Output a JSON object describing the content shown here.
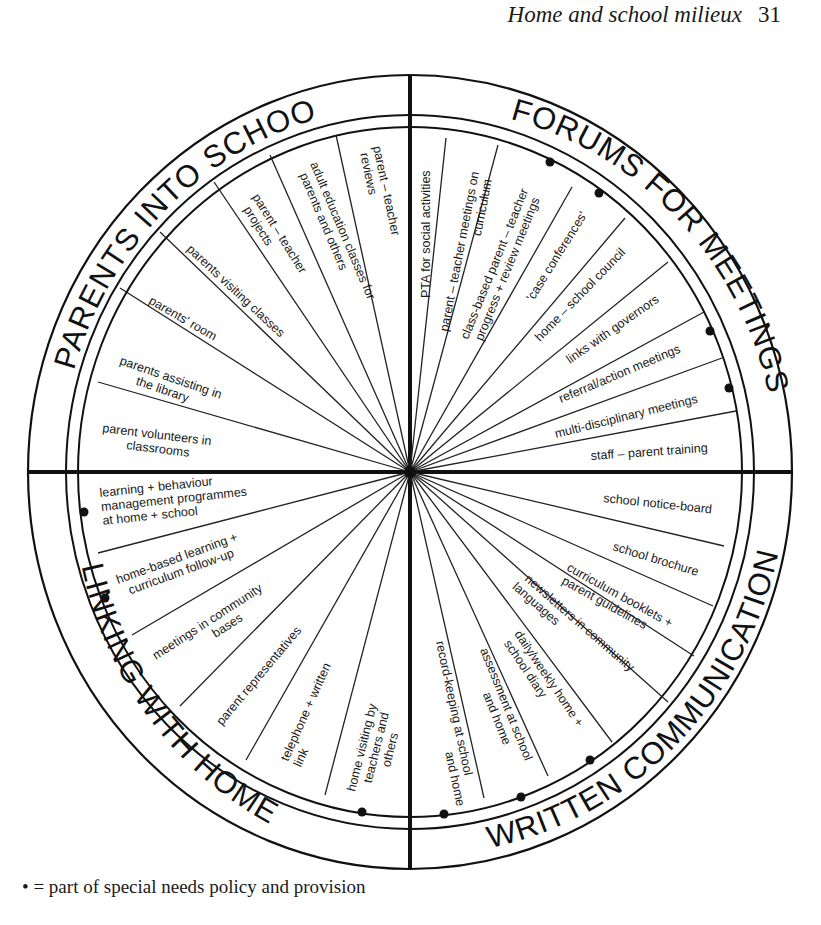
{
  "running_head": {
    "title": "Home and school milieux",
    "page": "31"
  },
  "diagram": {
    "type": "segmented circular diagram",
    "quadrants": [
      {
        "name": "PARENTS INTO SCHOOL",
        "position": "top-left",
        "items": [
          {
            "label": "parent – teacher reviews",
            "lines": [
              "parent – teacher",
              "reviews"
            ],
            "special_needs": false
          },
          {
            "label": "adult education classes for parents and others",
            "lines": [
              "adult education classes for",
              "parents and others"
            ],
            "special_needs": false
          },
          {
            "label": "parent – teacher projects",
            "lines": [
              "parent – teacher",
              "projects"
            ],
            "special_needs": false
          },
          {
            "label": "parents visiting classes",
            "lines": [
              "parents visiting classes"
            ],
            "special_needs": false
          },
          {
            "label": "parents' room",
            "lines": [
              "parents' room"
            ],
            "special_needs": false
          },
          {
            "label": "parents assisting in the library",
            "lines": [
              "parents assisting in",
              "the library"
            ],
            "special_needs": false
          },
          {
            "label": "parent volunteers in classrooms",
            "lines": [
              "parent volunteers in",
              "classrooms"
            ],
            "special_needs": false
          }
        ]
      },
      {
        "name": "FORUMS FOR MEETINGS",
        "position": "top-right",
        "items": [
          {
            "label": "PTA for social activities",
            "lines": [
              "PTA for social activities"
            ],
            "special_needs": false
          },
          {
            "label": "parent – teacher meetings on curriculum",
            "lines": [
              "parent – teacher meetings on",
              "curriculum"
            ],
            "special_needs": false
          },
          {
            "label": "class-based parent – teacher progress + review meetings",
            "lines": [
              "class-based parent – teacher",
              "progress + review meetings"
            ],
            "special_needs": true
          },
          {
            "label": "'case conferences'",
            "lines": [
              "'case conferences'"
            ],
            "special_needs": true
          },
          {
            "label": "home – school council",
            "lines": [
              "home – school council"
            ],
            "special_needs": false
          },
          {
            "label": "links with governors",
            "lines": [
              "links with governors"
            ],
            "special_needs": false
          },
          {
            "label": "referral/action meetings",
            "lines": [
              "referral/action meetings"
            ],
            "special_needs": true
          },
          {
            "label": "multi-disciplinary meetings",
            "lines": [
              "multi-disciplinary meetings"
            ],
            "special_needs": true
          },
          {
            "label": "staff – parent training",
            "lines": [
              "staff – parent training"
            ],
            "special_needs": false
          }
        ]
      },
      {
        "name": "WRITTEN COMMUNICATION",
        "position": "bottom-right",
        "items": [
          {
            "label": "school notice-board",
            "lines": [
              "school notice-board"
            ],
            "special_needs": false
          },
          {
            "label": "school brochure",
            "lines": [
              "school brochure"
            ],
            "special_needs": false
          },
          {
            "label": "curriculum booklets + parent guidelines",
            "lines": [
              "curriculum booklets +",
              "parent guidelines"
            ],
            "special_needs": false
          },
          {
            "label": "newsletters in community languages",
            "lines": [
              "newsletters in community",
              "languages"
            ],
            "special_needs": false
          },
          {
            "label": "daily/weekly home + school diary",
            "lines": [
              "daily/weekly home +",
              "school diary"
            ],
            "special_needs": true
          },
          {
            "label": "assessment at school and home",
            "lines": [
              "assessment at school",
              "and home"
            ],
            "special_needs": true
          },
          {
            "label": "record-keeping at school and home",
            "lines": [
              "record-keeping at school",
              "and home"
            ],
            "special_needs": true
          }
        ]
      },
      {
        "name": "LINKING WITH HOME",
        "position": "bottom-left",
        "items": [
          {
            "label": "learning + behaviour management programmes at home + school",
            "lines": [
              "learning + behaviour",
              "management programmes",
              "at home + school"
            ],
            "special_needs": true
          },
          {
            "label": "home-based learning + curriculum follow-up",
            "lines": [
              "home-based learning +",
              "curriculum follow-up"
            ],
            "special_needs": true
          },
          {
            "label": "meetings in community bases",
            "lines": [
              "meetings in community",
              "bases"
            ],
            "special_needs": false
          },
          {
            "label": "parent representatives",
            "lines": [
              "parent representatives"
            ],
            "special_needs": false
          },
          {
            "label": "telephone + written link",
            "lines": [
              "telephone + written",
              "link"
            ],
            "special_needs": false
          },
          {
            "label": "home visiting by teachers and others",
            "lines": [
              "home visiting by",
              "teachers and",
              "others"
            ],
            "special_needs": true
          }
        ]
      }
    ]
  },
  "legend": {
    "symbol": "•",
    "text": "= part of special needs policy and provision"
  }
}
